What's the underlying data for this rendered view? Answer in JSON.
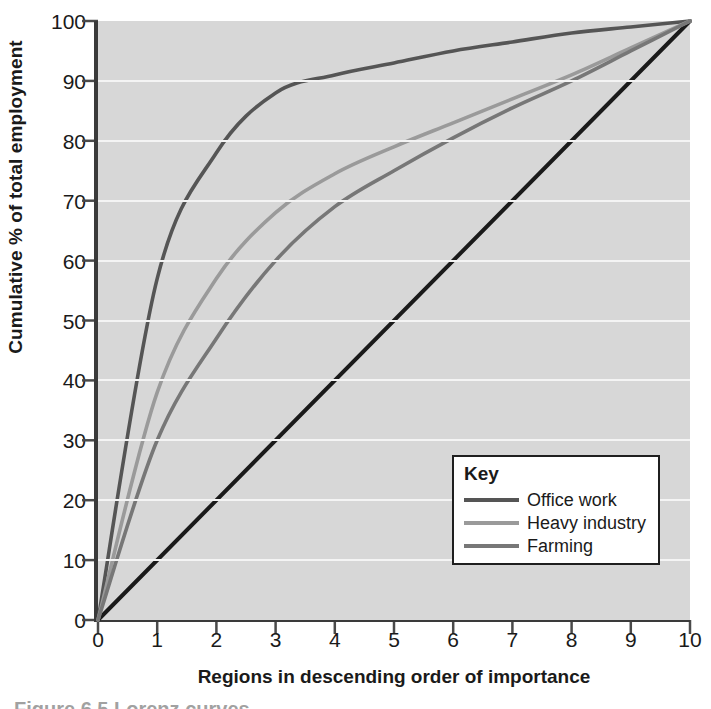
{
  "chart_data": {
    "type": "line",
    "title": "",
    "xlabel": "Regions in descending order of importance",
    "ylabel": "Cumulative % of total employment",
    "xlim": [
      0,
      10
    ],
    "ylim": [
      0,
      100
    ],
    "xticks": [
      "0",
      "1",
      "2",
      "3",
      "4",
      "5",
      "6",
      "7",
      "8",
      "9",
      "10"
    ],
    "yticks": [
      "0",
      "10",
      "20",
      "30",
      "40",
      "50",
      "60",
      "70",
      "80",
      "90",
      "100"
    ],
    "grid": "horizontal",
    "legend_position": "lower-right",
    "legend_title": "Key",
    "x": [
      0,
      1,
      2,
      3,
      4,
      5,
      6,
      7,
      8,
      9,
      10
    ],
    "series": [
      {
        "name": "Equality line",
        "color": "#1a1a1a",
        "in_legend": false,
        "values": [
          0,
          10,
          20,
          30,
          40,
          50,
          60,
          70,
          80,
          90,
          100
        ]
      },
      {
        "name": "Office work",
        "color": "#555555",
        "in_legend": true,
        "values": [
          0,
          57,
          78,
          88,
          91,
          93,
          95,
          96.5,
          98,
          99,
          100
        ]
      },
      {
        "name": "Heavy industry",
        "color": "#9a9a9a",
        "in_legend": true,
        "values": [
          0,
          38,
          57,
          68,
          74.5,
          79,
          83,
          87,
          91,
          95.5,
          100
        ]
      },
      {
        "name": "Farming",
        "color": "#777777",
        "in_legend": true,
        "values": [
          0,
          30,
          47,
          60,
          69,
          75,
          80.5,
          85.5,
          90,
          95,
          100
        ]
      }
    ]
  },
  "legend": {
    "title": "Key",
    "entries": [
      {
        "label": "Office work",
        "color": "#555555"
      },
      {
        "label": "Heavy industry",
        "color": "#9a9a9a"
      },
      {
        "label": "Farming",
        "color": "#777777"
      }
    ]
  },
  "caption": {
    "text": "Figure 6.5 Lorenz curves"
  }
}
